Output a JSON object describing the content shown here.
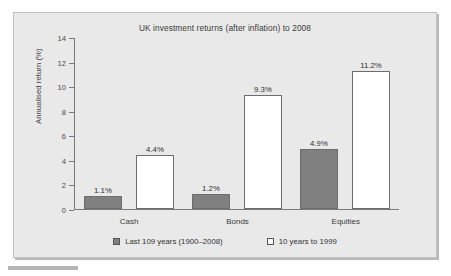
{
  "chart_data": {
    "type": "bar",
    "title": "UK investment returns (after inflation) to 2008",
    "xlabel": "",
    "ylabel": "Annualised return (%)",
    "ylim": [
      0,
      14
    ],
    "yticks": [
      0,
      2,
      4,
      6,
      8,
      10,
      12,
      14
    ],
    "ytick_labels": [
      "0",
      "2",
      "4",
      "6",
      "8",
      "10",
      "12",
      "14"
    ],
    "grid": false,
    "legend_position": "bottom",
    "categories": [
      "Cash",
      "Bonds",
      "Equities"
    ],
    "series": [
      {
        "name": "Last 109 years (1900–2008)",
        "color": "#808080",
        "values": [
          1.1,
          1.2,
          4.9
        ],
        "labels": [
          "1.1%",
          "1.2%",
          "4.9%"
        ]
      },
      {
        "name": "10 years to 1999",
        "color": "#ffffff",
        "values": [
          4.4,
          9.3,
          11.2
        ],
        "labels": [
          "4.4%",
          "9.3%",
          "11.2%"
        ]
      }
    ]
  },
  "legend": {
    "items": [
      {
        "label": "Last 109 years (1900–2008)",
        "swatch": "dark"
      },
      {
        "label": "10 years to 1999",
        "swatch": "light"
      }
    ]
  },
  "icons": {
    "legend_swatch_dark": "filled-square-icon",
    "legend_swatch_light": "empty-square-icon"
  }
}
